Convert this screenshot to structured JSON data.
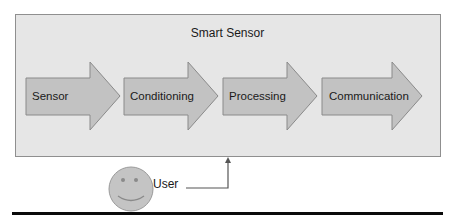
{
  "diagram": {
    "container": {
      "title": "Smart Sensor",
      "fill": "#e6e6e6",
      "border": "#8f8f8f"
    },
    "stages": [
      {
        "label": "Sensor"
      },
      {
        "label": "Conditioning"
      },
      {
        "label": "Processing"
      },
      {
        "label": "Communication"
      }
    ],
    "arrow_fill": "#c2c2c2",
    "arrow_stroke": "#8a8a8a",
    "actor": {
      "label": "User",
      "icon": "smiley-face-icon",
      "fill": "#c4c4c4"
    },
    "connector": {
      "from": "User",
      "to": "Smart Sensor"
    }
  }
}
